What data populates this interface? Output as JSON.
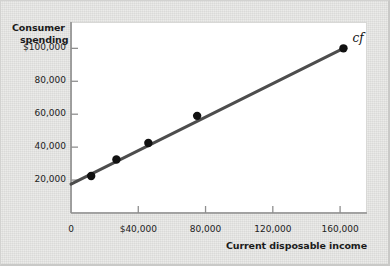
{
  "chart_data": {
    "type": "scatter",
    "title": "",
    "xlabel": "Current disposable income",
    "ylabel": "Consumer spending",
    "xlim": [
      0,
      176000
    ],
    "ylim": [
      0,
      116000
    ],
    "grid": false,
    "legend": null,
    "x_ticks": [
      {
        "value": 0,
        "label": "0"
      },
      {
        "value": 40000,
        "label": "$40,000"
      },
      {
        "value": 80000,
        "label": "80,000"
      },
      {
        "value": 120000,
        "label": "120,000"
      },
      {
        "value": 160000,
        "label": "160,000"
      }
    ],
    "y_ticks": [
      {
        "value": 20000,
        "label": "20,000"
      },
      {
        "value": 40000,
        "label": "40,000"
      },
      {
        "value": 60000,
        "label": "60,000"
      },
      {
        "value": 80000,
        "label": "80,000"
      },
      {
        "value": 100000,
        "label": "$100,000"
      }
    ],
    "points": [
      {
        "x": 12000,
        "y": 22500
      },
      {
        "x": 27000,
        "y": 32500
      },
      {
        "x": 46000,
        "y": 42500
      },
      {
        "x": 75000,
        "y": 59000
      },
      {
        "x": 162000,
        "y": 100000
      }
    ],
    "series": [
      {
        "name": "cf",
        "type": "line",
        "label": "cf",
        "intercept": 17500,
        "x_start": 0,
        "y_start": 17500,
        "x_end": 162000,
        "y_end": 100000
      }
    ],
    "colors": {
      "line": "#4d4d4d",
      "point": "#111111",
      "axis": "#8f8f8f",
      "plot_background": "#ffffff",
      "figure_background": "#e9e9e7",
      "text": "#1b1b1b"
    }
  },
  "axes": {
    "y_title_line1": "Consumer",
    "y_title_line2": "spending",
    "x_title": "Current disposable income"
  },
  "annotations": {
    "curve_label": "cf"
  }
}
